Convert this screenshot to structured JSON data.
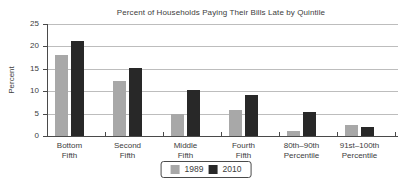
{
  "chart_data": {
    "type": "bar",
    "title": "Percent of Households Paying Their Bills Late by Quintile",
    "xlabel": "",
    "ylabel": "Percent",
    "ylim": [
      0,
      25
    ],
    "yticks": [
      0,
      5,
      10,
      15,
      20,
      25
    ],
    "grid": true,
    "legend_position": "bottom",
    "categories": [
      "Bottom Fifth",
      "Second Fifth",
      "Middle Fifth",
      "Fourth Fifth",
      "80th–90th Percentile",
      "91st–100th Percentile"
    ],
    "category_label_lines": [
      [
        "Bottom",
        "Fifth"
      ],
      [
        "Second",
        "Fifth"
      ],
      [
        "Middle",
        "Fifth"
      ],
      [
        "Fourth",
        "Fifth"
      ],
      [
        "80th–90th",
        "Percentile"
      ],
      [
        "91st–100th",
        "Percentile"
      ]
    ],
    "series": [
      {
        "name": "1989",
        "color": "#a8a8a8",
        "values": [
          18.0,
          12.2,
          5.0,
          5.9,
          1.1,
          2.4
        ]
      },
      {
        "name": "2010",
        "color": "#282828",
        "values": [
          21.2,
          15.2,
          10.2,
          9.1,
          5.3,
          2.1
        ]
      }
    ]
  },
  "colors": {
    "background": "#ffffff",
    "gridline": "#bdbdbd",
    "axis": "#4a4a4a",
    "text": "#3d3d3d"
  }
}
